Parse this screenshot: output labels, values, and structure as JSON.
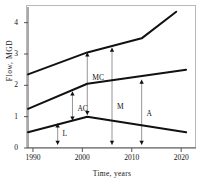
{
  "chart_data": {
    "type": "line",
    "title": "",
    "xlabel": "Time, years",
    "ylabel": "Flow, MGD",
    "xlim": [
      1989,
      2023
    ],
    "ylim": [
      0,
      4.5
    ],
    "xticks": [
      1990,
      2000,
      2010,
      2020
    ],
    "yticks": [
      0,
      1,
      2,
      3,
      4
    ],
    "grid": false,
    "legend": "none",
    "series": [
      {
        "name": "upper-curve",
        "x": [
          1989,
          2001,
          2012,
          2019
        ],
        "values": [
          2.35,
          3.05,
          3.5,
          4.35
        ]
      },
      {
        "name": "middle-curve",
        "x": [
          1989,
          2001,
          2021
        ],
        "values": [
          1.25,
          2.05,
          2.5
        ]
      },
      {
        "name": "lower-curve",
        "x": [
          1989,
          2001,
          2021
        ],
        "values": [
          0.5,
          1.0,
          0.5
        ]
      }
    ],
    "annotations": [
      {
        "label": "MC",
        "x": 2001,
        "y0": 1.05,
        "y1": 3.05,
        "label_x": 2002,
        "label_y": 2.25
      },
      {
        "label": "AC",
        "x": 1998,
        "y0": 0.88,
        "y1": 1.8,
        "label_x": 1999,
        "label_y": 1.25
      },
      {
        "label": "M",
        "x": 2006,
        "y0": 0.1,
        "y1": 3.2,
        "label_x": 2007,
        "label_y": 1.3
      },
      {
        "label": "A",
        "x": 2012,
        "y0": 0.1,
        "y1": 2.18,
        "label_x": 2013,
        "label_y": 1.1
      },
      {
        "label": "L",
        "x": 1995,
        "y0": 0.1,
        "y1": 0.78,
        "label_x": 1996,
        "label_y": 0.45
      }
    ]
  },
  "axes": {
    "ylabel": "Flow, MGD",
    "xlabel": "Time, years",
    "ytick_labels": [
      "0",
      "1",
      "2",
      "3",
      "4"
    ],
    "xtick_labels": [
      "1990",
      "2000",
      "2010",
      "2020"
    ]
  },
  "annotations": {
    "mc": "MC",
    "ac": "AC",
    "m": "M",
    "a": "A",
    "l": "L"
  },
  "colors": {
    "curve": "#111111",
    "frame": "#b9b9b9",
    "axis": "#555555",
    "arrow": "#8a8a8a",
    "text": "#111111"
  }
}
